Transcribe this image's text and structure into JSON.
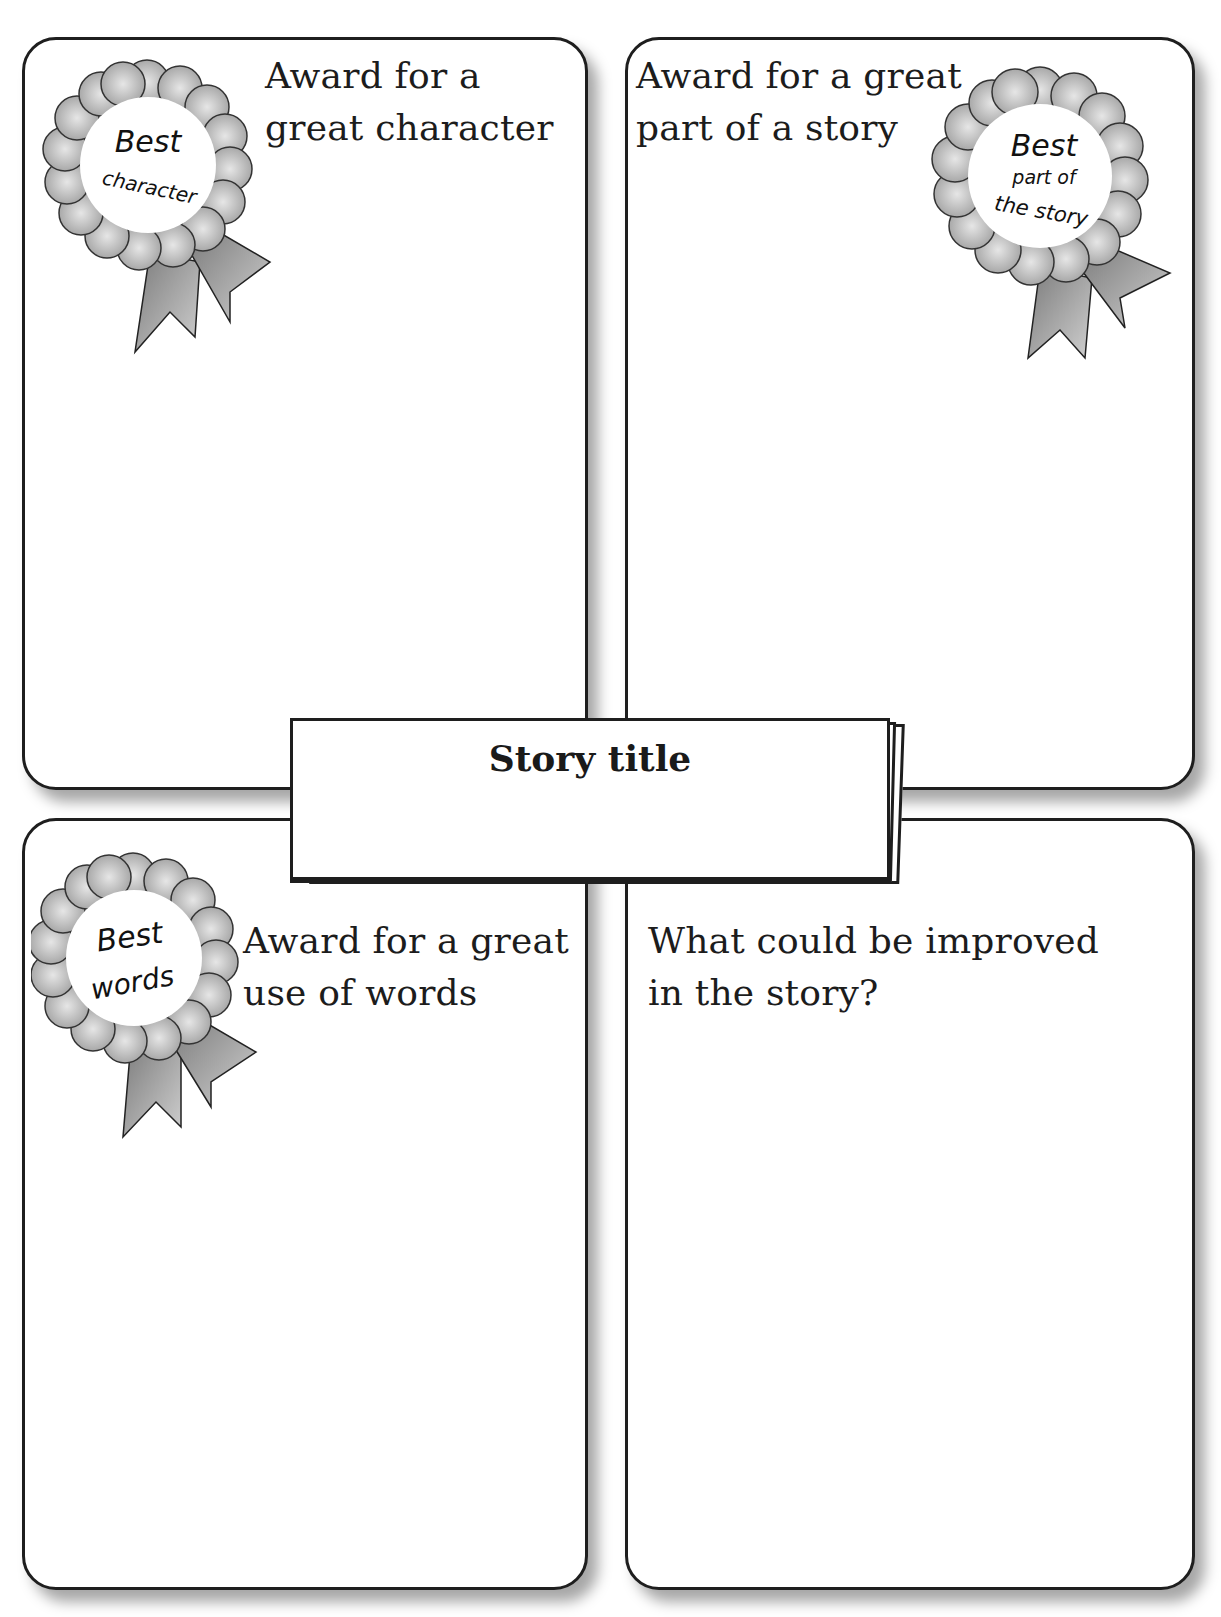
{
  "page": {
    "cut_off_header_visible": true
  },
  "cards": [
    {
      "position": "top-left",
      "label_line1": "Award for a",
      "label_line2": "great character",
      "rosette": {
        "line1": "Best",
        "line2": "character",
        "line3": ""
      }
    },
    {
      "position": "top-right",
      "label_line1": "Award for a great",
      "label_line2": "part of a story",
      "rosette": {
        "line1": "Best",
        "line2": "part of",
        "line3": "the story"
      }
    },
    {
      "position": "bottom-left",
      "label_line1": "Award for a great",
      "label_line2": "use of words",
      "rosette": {
        "line1": "Best",
        "line2": "words",
        "line3": ""
      }
    },
    {
      "position": "bottom-right",
      "label_line1": "What could be improved",
      "label_line2": "in the story?"
    }
  ],
  "banner": {
    "title": "Story title",
    "value": ""
  },
  "colors": {
    "border": "#1e1e1e",
    "rosette_petal": "#c8c8c8",
    "rosette_petal_dark": "#9a9a9a",
    "ribbon": "#a8a8a8",
    "background": "#ffffff"
  }
}
